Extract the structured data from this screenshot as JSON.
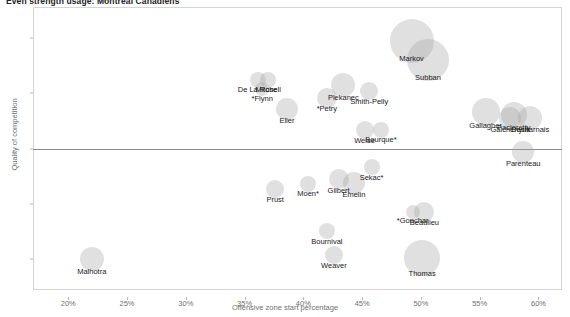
{
  "chart_title": "Even strength usage: Montreal Canadiens",
  "axes": {
    "xlabel": "Offensive zone start percentage",
    "ylabel": "Quality of competition",
    "xticks": [
      "20%",
      "25%",
      "30%",
      "35%",
      "40%",
      "45%",
      "50%",
      "55%",
      "60%"
    ],
    "xtick_values": [
      20,
      25,
      30,
      35,
      40,
      45,
      50,
      55,
      60
    ],
    "yticks": [
      "1.0",
      "0.5",
      "0.0",
      "-0.5",
      "-1.0"
    ],
    "ytick_values": [
      1.0,
      0.5,
      0.0,
      -0.5,
      -1.0
    ],
    "zero_reference_line": 0.0
  },
  "colors": {
    "bubble": "#a0a0a0",
    "frame": "#d5d5d5",
    "tick_text": "#6f6f6f",
    "label_text": "#1a1a1a",
    "zero_line": "#8d8d8d"
  },
  "chart_data": {
    "type": "scatter",
    "title": "Even strength usage: Montreal Canadiens",
    "xlabel": "Offensive zone start percentage",
    "ylabel": "Quality of competition",
    "xlim": [
      17.0,
      62.0
    ],
    "ylim": [
      -1.28,
      1.28
    ],
    "grid": false,
    "legend": "none",
    "size_encodes": "time on ice",
    "points": [
      {
        "label": "Markov",
        "x": 49.2,
        "y": 0.97,
        "size": 22
      },
      {
        "label": "Subban",
        "x": 50.6,
        "y": 0.8,
        "size": 21
      },
      {
        "label": "De La Rose",
        "x": 36.1,
        "y": 0.62,
        "size": 8
      },
      {
        "label": "Mitchell",
        "x": 37.0,
        "y": 0.62,
        "size": 8
      },
      {
        "label": "*Flynn",
        "x": 36.5,
        "y": 0.54,
        "size": 7
      },
      {
        "label": "Plekanec",
        "x": 43.4,
        "y": 0.57,
        "size": 12
      },
      {
        "label": "Smith-Pelly",
        "x": 45.6,
        "y": 0.52,
        "size": 9
      },
      {
        "label": "*Petry",
        "x": 42.0,
        "y": 0.46,
        "size": 10
      },
      {
        "label": "Eller",
        "x": 38.6,
        "y": 0.36,
        "size": 11
      },
      {
        "label": "Gallagher",
        "x": 55.5,
        "y": 0.33,
        "size": 14
      },
      {
        "label": "Galchenyuk",
        "x": 57.6,
        "y": 0.28,
        "size": 11
      },
      {
        "label": "Pacioretty",
        "x": 57.9,
        "y": 0.3,
        "size": 13
      },
      {
        "label": "Desharnais",
        "x": 59.3,
        "y": 0.28,
        "size": 12
      },
      {
        "label": "Weise",
        "x": 45.2,
        "y": 0.17,
        "size": 9
      },
      {
        "label": "Bourque*",
        "x": 46.6,
        "y": 0.17,
        "size": 8
      },
      {
        "label": "Parenteau",
        "x": 58.7,
        "y": -0.03,
        "size": 11
      },
      {
        "label": "Sekac*",
        "x": 45.8,
        "y": -0.17,
        "size": 8
      },
      {
        "label": "Gilbert",
        "x": 43.0,
        "y": -0.28,
        "size": 10
      },
      {
        "label": "Emelin",
        "x": 44.3,
        "y": -0.31,
        "size": 11
      },
      {
        "label": "Moen*",
        "x": 40.4,
        "y": -0.32,
        "size": 8
      },
      {
        "label": "Prust",
        "x": 37.6,
        "y": -0.37,
        "size": 9
      },
      {
        "label": "*Gonchar",
        "x": 49.3,
        "y": -0.57,
        "size": 7
      },
      {
        "label": "Beaulieu",
        "x": 50.3,
        "y": -0.57,
        "size": 10
      },
      {
        "label": "Bournival",
        "x": 42.0,
        "y": -0.75,
        "size": 8
      },
      {
        "label": "Weaver",
        "x": 42.6,
        "y": -0.96,
        "size": 9
      },
      {
        "label": "Thomas",
        "x": 50.1,
        "y": -0.99,
        "size": 18
      },
      {
        "label": "Malhotra",
        "x": 22.0,
        "y": -1.0,
        "size": 12
      }
    ]
  }
}
